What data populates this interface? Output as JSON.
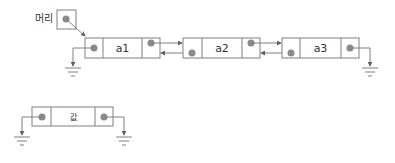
{
  "diagram": {
    "head": {
      "label": "머리"
    },
    "nodes": [
      {
        "label": "a1"
      },
      {
        "label": "a2"
      },
      {
        "label": "a3"
      }
    ],
    "single_node": {
      "label": "값"
    },
    "colors": {
      "stroke": "#808080",
      "dot": "#8a8a8a",
      "text": "#333333"
    }
  }
}
